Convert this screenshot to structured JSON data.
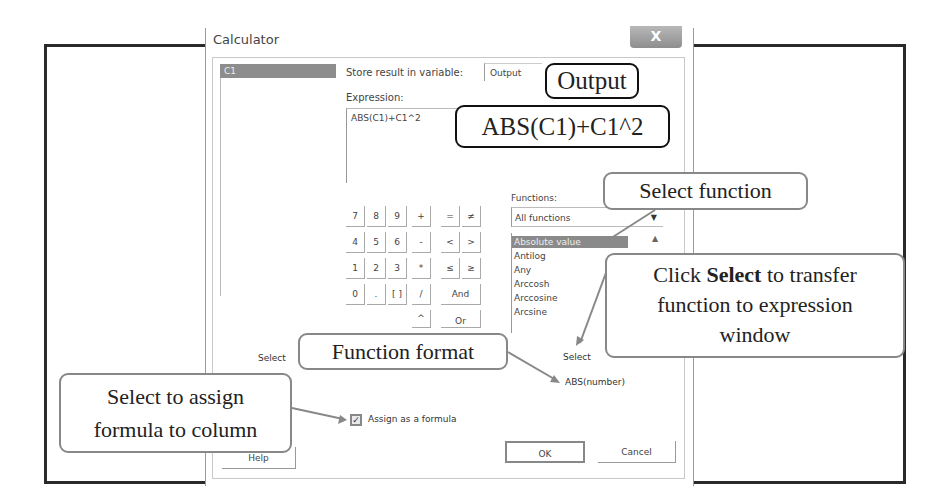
{
  "window": {
    "title": "Calculator",
    "close_label": "X"
  },
  "variables": {
    "items": [
      "C1"
    ]
  },
  "store": {
    "label": "Store result in variable:",
    "value": "Output"
  },
  "expression": {
    "label": "Expression:",
    "value": "ABS(C1)+C1^2"
  },
  "keypad": {
    "rows": [
      [
        "7",
        "8",
        "9",
        "+",
        "=",
        "≠"
      ],
      [
        "4",
        "5",
        "6",
        "-",
        "<",
        ">"
      ],
      [
        "1",
        "2",
        "3",
        "*",
        "≤",
        "≥"
      ],
      [
        "0",
        ".",
        "[ ]",
        "/",
        "And"
      ],
      [
        "^",
        "Or"
      ]
    ]
  },
  "functions": {
    "label": "Functions:",
    "category": "All functions",
    "items": [
      "Absolute value",
      "Antilog",
      "Any",
      "Arccosh",
      "Arccosine",
      "Arcsine"
    ],
    "selected": "Absolute value",
    "format": "ABS(number)"
  },
  "buttons": {
    "select_left": "Select",
    "select_right": "Select",
    "help": "Help",
    "ok": "OK",
    "cancel": "Cancel"
  },
  "assign_formula": {
    "label": "Assign as a formula",
    "checked": true
  },
  "callouts": {
    "output": "Output",
    "expression": "ABS(C1)+C1^2",
    "select_function": "Select function",
    "click_select_pre": "Click ",
    "click_select_bold": "Select",
    "click_select_post": " to transfer",
    "click_select_line2": "function to expression",
    "click_select_line3": "window",
    "function_format": "Function format",
    "assign_line1": "Select to assign",
    "assign_line2": "formula to column"
  }
}
